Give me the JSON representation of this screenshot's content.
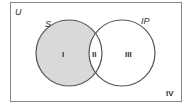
{
  "diagram": {
    "type": "venn",
    "universe_label": "U",
    "sets": [
      {
        "label": "S",
        "shaded_only_region": "I"
      },
      {
        "label": "IP"
      }
    ],
    "regions": [
      {
        "id": "I",
        "label": "I",
        "shaded": true
      },
      {
        "id": "II",
        "label": "II",
        "shaded": false
      },
      {
        "id": "III",
        "label": "III",
        "shaded": false
      },
      {
        "id": "IV",
        "label": "IV",
        "shaded": false
      }
    ],
    "colors": {
      "shade": "#d9d9d9",
      "stroke": "#555555",
      "border": "#888888",
      "text": "#333333"
    }
  }
}
